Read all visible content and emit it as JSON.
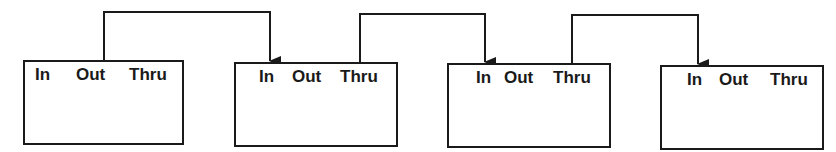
{
  "diagram": {
    "type": "daisy-chain",
    "colors": {
      "line": "#1a1a1a",
      "background": "#ffffff",
      "text": "#1a1a1a"
    },
    "devices": [
      {
        "id": "device-1",
        "ports": {
          "in": "In",
          "out": "Out",
          "thru": "Thru"
        },
        "box": {
          "x": 23,
          "y": 60,
          "w": 161,
          "h": 85
        },
        "label_x": {
          "in": 12,
          "out": 53,
          "thru": 106
        }
      },
      {
        "id": "device-2",
        "ports": {
          "in": "In",
          "out": "Out",
          "thru": "Thru"
        },
        "box": {
          "x": 234,
          "y": 62,
          "w": 164,
          "h": 85
        },
        "label_x": {
          "in": 25,
          "out": 58,
          "thru": 106
        }
      },
      {
        "id": "device-3",
        "ports": {
          "in": "In",
          "out": "Out",
          "thru": "Thru"
        },
        "box": {
          "x": 447,
          "y": 63,
          "w": 164,
          "h": 85
        },
        "label_x": {
          "in": 29,
          "out": 57,
          "thru": 106
        }
      },
      {
        "id": "device-4",
        "ports": {
          "in": "In",
          "out": "Out",
          "thru": "Thru"
        },
        "box": {
          "x": 660,
          "y": 65,
          "w": 164,
          "h": 85
        },
        "label_x": {
          "in": 27,
          "out": 59,
          "thru": 110
        }
      }
    ],
    "connections": [
      {
        "from": "device-1",
        "from_port": "Out",
        "to": "device-2",
        "to_port": "In",
        "x1": 104,
        "y_from": 60,
        "y_top": 12,
        "x2": 270,
        "y_to": 62
      },
      {
        "from": "device-2",
        "from_port": "Thru",
        "to": "device-3",
        "to_port": "In",
        "x1": 360,
        "y_from": 62,
        "y_top": 14,
        "x2": 485,
        "y_to": 63
      },
      {
        "from": "device-3",
        "from_port": "Thru",
        "to": "device-4",
        "to_port": "In",
        "x1": 572,
        "y_from": 63,
        "y_top": 15,
        "x2": 698,
        "y_to": 65
      }
    ]
  }
}
